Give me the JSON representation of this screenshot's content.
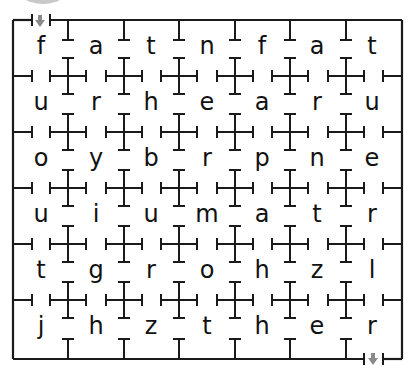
{
  "puzzle": {
    "type": "letter-maze",
    "rows": 6,
    "cols": 7,
    "grid": [
      [
        "f",
        "a",
        "t",
        "n",
        "f",
        "a",
        "t"
      ],
      [
        "u",
        "r",
        "h",
        "e",
        "a",
        "r",
        "u"
      ],
      [
        "o",
        "y",
        "b",
        "r",
        "p",
        "n",
        "e"
      ],
      [
        "u",
        "i",
        "u",
        "m",
        "a",
        "t",
        "r"
      ],
      [
        "t",
        "g",
        "r",
        "o",
        "h",
        "z",
        "l"
      ],
      [
        "j",
        "h",
        "z",
        "t",
        "h",
        "e",
        "r"
      ]
    ],
    "entry": {
      "label": "start-arrow",
      "position": "top-left",
      "icon": "down-arrow-icon"
    },
    "exit": {
      "label": "finish-arrow",
      "position": "bottom-right",
      "icon": "down-arrow-icon"
    }
  },
  "colors": {
    "line": "#1a1a1a",
    "arrow": "#8a8a8a",
    "circle": "#c8c8c8",
    "text": "#111111"
  }
}
